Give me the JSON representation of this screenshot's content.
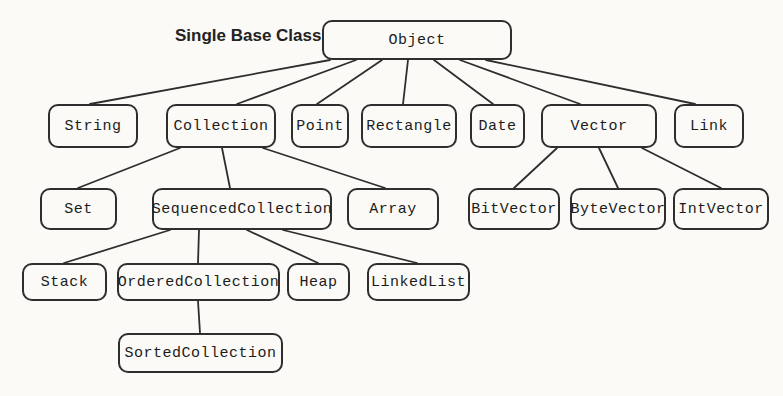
{
  "diagram": {
    "title_label": "Single Base Class",
    "nodes": [
      {
        "id": "object",
        "label": "Object",
        "x": 322,
        "y": 20,
        "w": 190,
        "h": 40
      },
      {
        "id": "string",
        "label": "String",
        "x": 48,
        "y": 104,
        "w": 90,
        "h": 44
      },
      {
        "id": "collection",
        "label": "Collection",
        "x": 166,
        "y": 104,
        "w": 110,
        "h": 44
      },
      {
        "id": "point",
        "label": "Point",
        "x": 291,
        "y": 104,
        "w": 58,
        "h": 44
      },
      {
        "id": "rectangle",
        "label": "Rectangle",
        "x": 361,
        "y": 104,
        "w": 96,
        "h": 44
      },
      {
        "id": "date",
        "label": "Date",
        "x": 470,
        "y": 104,
        "w": 55,
        "h": 44
      },
      {
        "id": "vector",
        "label": "Vector",
        "x": 541,
        "y": 104,
        "w": 116,
        "h": 44
      },
      {
        "id": "link",
        "label": "Link",
        "x": 674,
        "y": 104,
        "w": 70,
        "h": 44
      },
      {
        "id": "set",
        "label": "Set",
        "x": 40,
        "y": 188,
        "w": 77,
        "h": 42
      },
      {
        "id": "sequencedcollection",
        "label": "SequencedCollection",
        "x": 152,
        "y": 188,
        "w": 180,
        "h": 42
      },
      {
        "id": "array",
        "label": "Array",
        "x": 347,
        "y": 188,
        "w": 92,
        "h": 42
      },
      {
        "id": "bitvector",
        "label": "BitVector",
        "x": 468,
        "y": 188,
        "w": 92,
        "h": 42
      },
      {
        "id": "bytevector",
        "label": "ByteVector",
        "x": 570,
        "y": 188,
        "w": 96,
        "h": 42
      },
      {
        "id": "intvector",
        "label": "IntVector",
        "x": 673,
        "y": 188,
        "w": 96,
        "h": 42
      },
      {
        "id": "stack",
        "label": "Stack",
        "x": 22,
        "y": 263,
        "w": 85,
        "h": 38
      },
      {
        "id": "orderedcollection",
        "label": "OrderedCollection",
        "x": 117,
        "y": 263,
        "w": 163,
        "h": 38
      },
      {
        "id": "heap",
        "label": "Heap",
        "x": 287,
        "y": 263,
        "w": 63,
        "h": 38
      },
      {
        "id": "linkedlist",
        "label": "LinkedList",
        "x": 367,
        "y": 263,
        "w": 103,
        "h": 38
      },
      {
        "id": "sortedcollection",
        "label": "SortedCollection",
        "x": 118,
        "y": 333,
        "w": 165,
        "h": 40
      }
    ],
    "edges": [
      {
        "from": "object",
        "to": "string",
        "x1": 330,
        "y1": 60,
        "x2": 90,
        "y2": 104
      },
      {
        "from": "object",
        "to": "collection",
        "x1": 356,
        "y1": 60,
        "x2": 237,
        "y2": 104
      },
      {
        "from": "object",
        "to": "point",
        "x1": 382,
        "y1": 60,
        "x2": 317,
        "y2": 104
      },
      {
        "from": "object",
        "to": "rectangle",
        "x1": 408,
        "y1": 60,
        "x2": 403,
        "y2": 104
      },
      {
        "from": "object",
        "to": "date",
        "x1": 434,
        "y1": 60,
        "x2": 493,
        "y2": 104
      },
      {
        "from": "object",
        "to": "vector",
        "x1": 460,
        "y1": 60,
        "x2": 580,
        "y2": 104
      },
      {
        "from": "object",
        "to": "link",
        "x1": 486,
        "y1": 60,
        "x2": 695,
        "y2": 104
      },
      {
        "from": "collection",
        "to": "set",
        "x1": 180,
        "y1": 148,
        "x2": 78,
        "y2": 188
      },
      {
        "from": "collection",
        "to": "sequencedcollection",
        "x1": 222,
        "y1": 148,
        "x2": 230,
        "y2": 188
      },
      {
        "from": "collection",
        "to": "array",
        "x1": 263,
        "y1": 148,
        "x2": 385,
        "y2": 188
      },
      {
        "from": "vector",
        "to": "bitvector",
        "x1": 557,
        "y1": 148,
        "x2": 514,
        "y2": 188
      },
      {
        "from": "vector",
        "to": "bytevector",
        "x1": 599,
        "y1": 148,
        "x2": 618,
        "y2": 188
      },
      {
        "from": "vector",
        "to": "intvector",
        "x1": 642,
        "y1": 148,
        "x2": 721,
        "y2": 188
      },
      {
        "from": "sequencedcollection",
        "to": "stack",
        "x1": 170,
        "y1": 230,
        "x2": 64,
        "y2": 263
      },
      {
        "from": "sequencedcollection",
        "to": "orderedcollection",
        "x1": 199,
        "y1": 230,
        "x2": 198,
        "y2": 263
      },
      {
        "from": "sequencedcollection",
        "to": "heap",
        "x1": 247,
        "y1": 230,
        "x2": 318,
        "y2": 263
      },
      {
        "from": "sequencedcollection",
        "to": "linkedlist",
        "x1": 283,
        "y1": 230,
        "x2": 417,
        "y2": 263
      },
      {
        "from": "orderedcollection",
        "to": "sortedcollection",
        "x1": 198,
        "y1": 301,
        "x2": 200,
        "y2": 333
      }
    ]
  },
  "colors": {
    "background": "#fbfaf7",
    "line": "#2e2e2e",
    "box_border": "#2e2e2e",
    "text": "#1c1c1c"
  }
}
